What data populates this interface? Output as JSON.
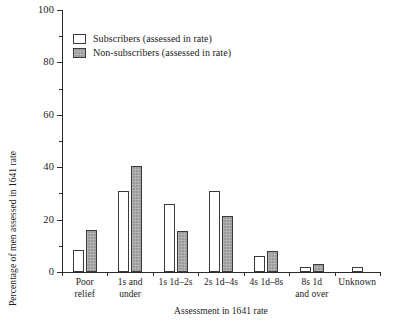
{
  "chart_data": {
    "type": "bar",
    "title": "",
    "xlabel": "Assessment in 1641 rate",
    "ylabel": "Percentage of men assessed in 1641 rate",
    "ylim": [
      0,
      100
    ],
    "yticks": [
      0,
      20,
      40,
      60,
      80,
      100
    ],
    "ytick_labels": [
      "0",
      "20",
      "40",
      "60",
      "80",
      "100"
    ],
    "yminor_ticks": [
      10,
      30,
      50,
      70,
      90
    ],
    "grid": false,
    "legend_position": "upper-left-inside",
    "categories": [
      "Poor relief",
      "1s and under",
      "1s 1d–2s",
      "2s 1d–4s",
      "4s 1d–8s",
      "8s 1d and over",
      "Unknown"
    ],
    "category_lines": [
      [
        "Poor",
        "relief"
      ],
      [
        "1s and",
        "under"
      ],
      [
        "1s 1d–2s",
        ""
      ],
      [
        "2s 1d–4s",
        ""
      ],
      [
        "4s 1d–8s",
        ""
      ],
      [
        "8s 1d",
        "and over"
      ],
      [
        "Unknown",
        ""
      ]
    ],
    "series": [
      {
        "name": "Subscribers (assessed in rate)",
        "fill": "#ffffff",
        "values": [
          8.5,
          31,
          26,
          31,
          6,
          2,
          2
        ]
      },
      {
        "name": "Non-subscribers (assessed in rate)",
        "fill": "#9a9a9a",
        "values": [
          16,
          40.5,
          15.5,
          21.5,
          8,
          3,
          0
        ]
      }
    ]
  },
  "legend": {
    "items": [
      {
        "label": "Subscribers (assessed in rate)"
      },
      {
        "label": "Non-subscribers (assessed in rate)"
      }
    ]
  }
}
